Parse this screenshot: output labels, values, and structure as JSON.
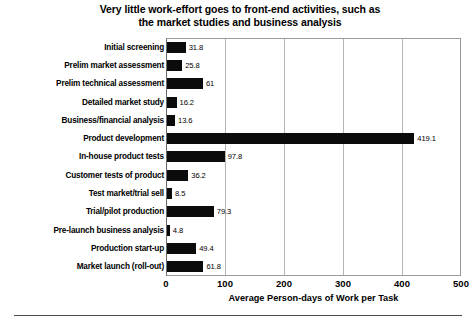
{
  "chart_data": {
    "type": "bar",
    "orientation": "horizontal",
    "title": "Very little work-effort goes to front-end activities, such as the market studies and business  analysis",
    "title_lines": [
      "Very little work-effort goes to front-end activities, such as",
      "the market studies and business  analysis"
    ],
    "xlabel": "Average Person-days of Work per Task",
    "ylabel": "",
    "xlim": [
      0,
      500
    ],
    "xticks": [
      0,
      100,
      200,
      300,
      400,
      500
    ],
    "xtick_labels": [
      "0",
      "100",
      "200",
      "300",
      "400",
      "500"
    ],
    "grid": true,
    "grid_axis": "x",
    "legend": false,
    "bar_color": "#0b0b0b",
    "categories": [
      "Initial screening",
      "Prelim market assessment",
      "Prelim technical assessment",
      "Detailed market study",
      "Business/financial analysis",
      "Product development",
      "In-house product tests",
      "Customer tests of product",
      "Test market/trial sell",
      "Trial/pilot production",
      "Pre-launch business analysis",
      "Production start-up",
      "Market launch (roll-out)"
    ],
    "values": [
      31.8,
      25.8,
      61,
      16.2,
      13.6,
      419.1,
      97.8,
      36.2,
      8.5,
      79.3,
      4.8,
      49.4,
      61.8
    ],
    "value_labels": [
      "31.8",
      "25.8",
      "61",
      "16.2",
      "13.6",
      "419.1",
      "97.8",
      "36.2",
      "8.5",
      "79.3",
      "4.8",
      "49.4",
      "61.8"
    ]
  }
}
